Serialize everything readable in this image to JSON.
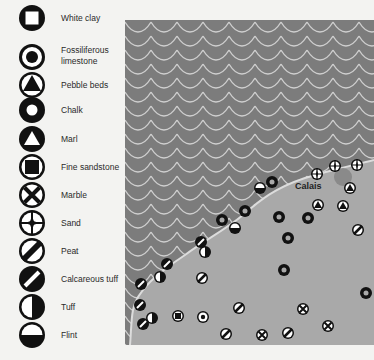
{
  "legend": {
    "items": [
      {
        "label": "White clay",
        "symbol": "square-in-circle"
      },
      {
        "label": "Fossiliferous limestone",
        "symbol": "dot-in-ring"
      },
      {
        "label": "Pebble beds",
        "symbol": "triangle-in-circle"
      },
      {
        "label": "Chalk",
        "symbol": "thick-ring"
      },
      {
        "label": "Marl",
        "symbol": "white-triangle-in-black-circle"
      },
      {
        "label": "Fine sandstone",
        "symbol": "black-square-in-circle"
      },
      {
        "label": "Marble",
        "symbol": "x-in-circle"
      },
      {
        "label": "Sand",
        "symbol": "star-in-circle"
      },
      {
        "label": "Peat",
        "symbol": "diagonal-bar-circle"
      },
      {
        "label": "Calcareous tuff",
        "symbol": "black-circle-white-bar"
      },
      {
        "label": "Tuff",
        "symbol": "half-black-right"
      },
      {
        "label": "Flint",
        "symbol": "half-black-bottom"
      }
    ]
  },
  "map": {
    "place_label": "Calais",
    "colors": {
      "sea": "#7c7c7c",
      "land": "#a9a9a9",
      "wave": "#cfcfcf",
      "coast": "#dcdcdc",
      "marker": "#111111",
      "town": "#8a8a8a"
    }
  }
}
